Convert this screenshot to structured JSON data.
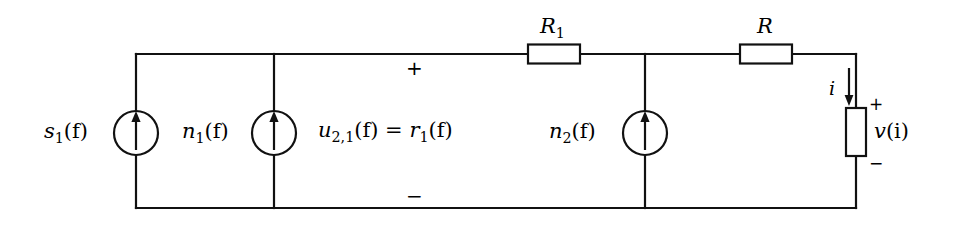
{
  "figure": {
    "kind": "circuit-schematic",
    "width": 955,
    "height": 226,
    "background_color": "#ffffff",
    "line_color": "#000000"
  },
  "labels": {
    "source_s1": {
      "base": "s",
      "sub": "1",
      "arg": "(f)",
      "text": "s₁(f)"
    },
    "source_n1": {
      "base": "n",
      "sub": "1",
      "arg": "(f)",
      "text": "n₁(f)"
    },
    "source_n2": {
      "base": "n",
      "sub": "2",
      "arg": "(f)",
      "text": "n₂(f)"
    },
    "node_voltage": {
      "lhs_base": "u",
      "lhs_sub": "2,1",
      "lhs_arg": "(f)",
      "equals": "=",
      "rhs_base": "r",
      "rhs_sub": "1",
      "rhs_arg": "(f)",
      "text": "u₂,₁(f) = r₁(f)"
    },
    "resistor_r1": {
      "base": "R",
      "sub": "1",
      "text": "R₁"
    },
    "resistor_r": {
      "base": "R",
      "sub": "",
      "text": "R"
    },
    "current_i": {
      "text": "i"
    },
    "load_voltage": {
      "base": "v",
      "arg": "(i)",
      "text": "v(i)"
    }
  },
  "polarity": {
    "node_plus": "+",
    "node_minus": "−",
    "load_plus": "+",
    "load_minus": "−"
  },
  "components": [
    {
      "name": "current-source-s1",
      "type": "current-source",
      "label": "s₁(f)",
      "arrow_direction": "up",
      "cx": 136,
      "cy": 133,
      "r": 22
    },
    {
      "name": "current-source-n1",
      "type": "current-source",
      "label": "n₁(f)",
      "arrow_direction": "up",
      "cx": 274,
      "cy": 133,
      "r": 22
    },
    {
      "name": "current-source-n2",
      "type": "current-source",
      "label": "n₂(f)",
      "arrow_direction": "up",
      "cx": 645,
      "cy": 133,
      "r": 22
    },
    {
      "name": "resistor-r1",
      "type": "resistor",
      "orientation": "horizontal",
      "label": "R₁",
      "x": 528,
      "y": 45,
      "w": 52,
      "h": 19
    },
    {
      "name": "resistor-r",
      "type": "resistor",
      "orientation": "horizontal",
      "label": "R",
      "x": 740,
      "y": 45,
      "w": 52,
      "h": 19
    },
    {
      "name": "resistor-load",
      "type": "resistor",
      "orientation": "vertical",
      "label": "v(i)",
      "x": 846,
      "y": 108,
      "w": 20,
      "h": 48
    }
  ],
  "wires": {
    "top_rail_y": 54,
    "bottom_rail_y": 208,
    "left_rail_x": 136,
    "right_rail_x": 856,
    "node_n1_x": 274,
    "node_n2_x": 645
  }
}
